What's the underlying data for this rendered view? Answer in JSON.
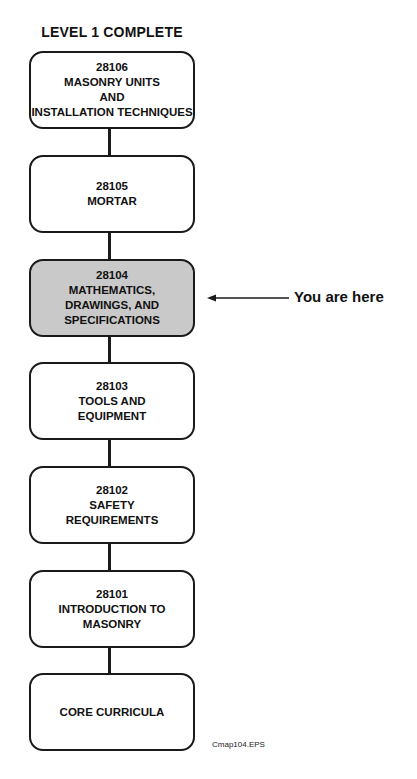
{
  "diagram": {
    "title": "LEVEL 1 COMPLETE",
    "modules": [
      {
        "code": "28106",
        "lines": [
          "28106",
          "MASONRY UNITS",
          "AND",
          "INSTALLATION TECHNIQUES"
        ],
        "current": false
      },
      {
        "code": "28105",
        "lines": [
          "28105",
          "MORTAR"
        ],
        "current": false
      },
      {
        "code": "28104",
        "lines": [
          "28104",
          "MATHEMATICS,",
          "DRAWINGS, AND",
          "SPECIFICATIONS"
        ],
        "current": true
      },
      {
        "code": "28103",
        "lines": [
          "28103",
          "TOOLS AND",
          "EQUIPMENT"
        ],
        "current": false
      },
      {
        "code": "28102",
        "lines": [
          "28102",
          "SAFETY",
          "REQUIREMENTS"
        ],
        "current": false
      },
      {
        "code": "28101",
        "lines": [
          "28101",
          "INTRODUCTION TO",
          "MASONRY"
        ],
        "current": false
      },
      {
        "code": "",
        "lines": [
          "CORE CURRICULA"
        ],
        "current": false
      }
    ],
    "pointer_label": "You are here",
    "figure_id": "Cmap104.EPS",
    "colors": {
      "current_fill": "#c9c9c9",
      "stroke": "#1a1a1a"
    }
  }
}
